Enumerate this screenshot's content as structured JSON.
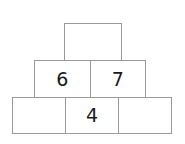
{
  "puzzle": {
    "type": "number-pyramid",
    "title": "Number Pyramid",
    "rows": [
      {
        "name": "top-row",
        "level": 1,
        "cells": [
          {
            "value": "",
            "filled": false
          }
        ]
      },
      {
        "name": "middle-row",
        "level": 2,
        "cells": [
          {
            "value": "6",
            "filled": true
          },
          {
            "value": "7",
            "filled": true
          }
        ]
      },
      {
        "name": "bottom-row",
        "level": 3,
        "cells": [
          {
            "value": "",
            "filled": false
          },
          {
            "value": "4",
            "filled": true
          },
          {
            "value": "",
            "filled": false
          }
        ]
      }
    ]
  },
  "style": {
    "border_color": "#9a9a9a",
    "cell_fill": "#ffffff",
    "text_color": "#1a1a1a",
    "page_background": "#ffffff"
  }
}
